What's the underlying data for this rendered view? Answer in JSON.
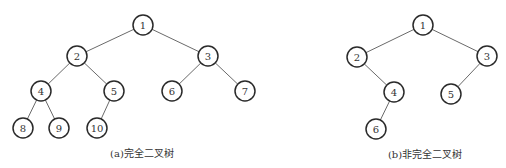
{
  "diagrams": [
    {
      "id": "a",
      "caption": "(a)完全二叉树",
      "caption_pos": [
        142,
        157
      ],
      "nodes": [
        {
          "label": "1",
          "x": 143,
          "y": 25
        },
        {
          "label": "2",
          "x": 77,
          "y": 56
        },
        {
          "label": "3",
          "x": 208,
          "y": 56
        },
        {
          "label": "4",
          "x": 41,
          "y": 91
        },
        {
          "label": "5",
          "x": 114,
          "y": 91
        },
        {
          "label": "6",
          "x": 172,
          "y": 91
        },
        {
          "label": "7",
          "x": 245,
          "y": 91
        },
        {
          "label": "8",
          "x": 23,
          "y": 128
        },
        {
          "label": "9",
          "x": 59,
          "y": 128
        },
        {
          "label": "10",
          "x": 97,
          "y": 128
        }
      ],
      "edges": [
        [
          "1",
          "2"
        ],
        [
          "1",
          "3"
        ],
        [
          "2",
          "4"
        ],
        [
          "2",
          "5"
        ],
        [
          "3",
          "6"
        ],
        [
          "3",
          "7"
        ],
        [
          "4",
          "8"
        ],
        [
          "4",
          "9"
        ],
        [
          "5",
          "10"
        ]
      ]
    },
    {
      "id": "b",
      "caption": "(b)非完全二叉树",
      "caption_pos": [
        425,
        158
      ],
      "nodes": [
        {
          "label": "1",
          "x": 423,
          "y": 25
        },
        {
          "label": "2",
          "x": 357,
          "y": 57
        },
        {
          "label": "3",
          "x": 487,
          "y": 56
        },
        {
          "label": "4",
          "x": 394,
          "y": 92
        },
        {
          "label": "5",
          "x": 451,
          "y": 94
        },
        {
          "label": "6",
          "x": 376,
          "y": 129
        }
      ],
      "edges": [
        [
          "1",
          "2"
        ],
        [
          "1",
          "3"
        ],
        [
          "2",
          "4"
        ],
        [
          "3",
          "5"
        ],
        [
          "4",
          "6"
        ]
      ]
    }
  ],
  "style": {
    "node_radius": 10,
    "node_stroke": "#2a2a2a",
    "edge_stroke": "#6a6a6a",
    "text_color": "#333333"
  }
}
